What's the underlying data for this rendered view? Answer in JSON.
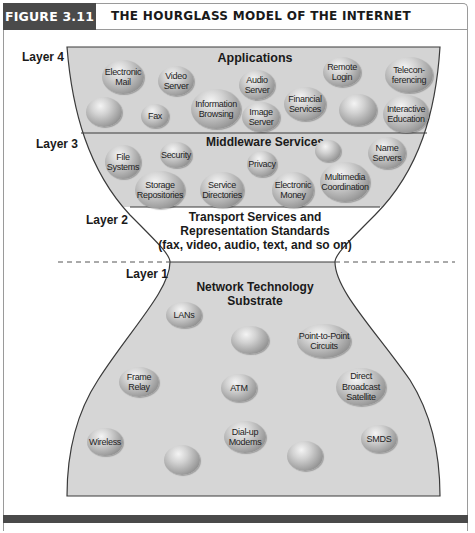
{
  "figure": {
    "label": "FIGURE 3.11",
    "title": "THE HOURGLASS MODEL OF THE INTERNET"
  },
  "colors": {
    "header_bg": "#4a4a4a",
    "header_text": "#ffffff",
    "fill_gray": "#d4d4d4",
    "outline": "#3a3a3a",
    "bottom_bar": "#4a4a4a"
  },
  "layers": {
    "layer4": {
      "label": "Layer 4",
      "title": "Applications"
    },
    "layer3": {
      "label": "Layer 3",
      "title": "Middleware Services"
    },
    "layer2": {
      "label": "Layer 2",
      "title_line1": "Transport Services and",
      "title_line2": "Representation Standards",
      "title_line3": "(fax, video, audio, text, and so on)"
    },
    "layer1": {
      "label": "Layer 1",
      "title": "Network Technology Substrate"
    }
  },
  "bubbles": {
    "applications": [
      {
        "label": "Electronic\nMail"
      },
      {
        "label": "Video\nServer"
      },
      {
        "label": "Audio\nServer"
      },
      {
        "label": "Remote\nLogin"
      },
      {
        "label": "Telecon-\nferencing"
      },
      {
        "label": ""
      },
      {
        "label": "Fax"
      },
      {
        "label": "Information\nBrowsing"
      },
      {
        "label": "Image\nServer"
      },
      {
        "label": "Financial\nServices"
      },
      {
        "label": ""
      },
      {
        "label": "Interactive\nEducation"
      }
    ],
    "middleware": [
      {
        "label": "File\nSystems"
      },
      {
        "label": "Security"
      },
      {
        "label": "Privacy"
      },
      {
        "label": ""
      },
      {
        "label": "Name\nServers"
      },
      {
        "label": "Storage\nRepositories"
      },
      {
        "label": "Service\nDirectories"
      },
      {
        "label": "Electronic\nMoney"
      },
      {
        "label": "Multimedia\nCoordination"
      }
    ],
    "network": [
      {
        "label": "LANs"
      },
      {
        "label": ""
      },
      {
        "label": "Point-to-Point\nCircuits"
      },
      {
        "label": "Frame\nRelay"
      },
      {
        "label": "ATM"
      },
      {
        "label": "Direct\nBroadcast\nSatellite"
      },
      {
        "label": "Wireless"
      },
      {
        "label": "Dial-up\nModems"
      },
      {
        "label": "SMDS"
      },
      {
        "label": ""
      },
      {
        "label": ""
      }
    ]
  }
}
